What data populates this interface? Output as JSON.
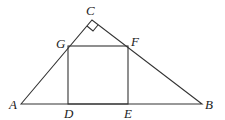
{
  "diagram": {
    "type": "geometry",
    "points": {
      "A": {
        "label": "A",
        "x": 21,
        "y": 104
      },
      "B": {
        "label": "B",
        "x": 202,
        "y": 104
      },
      "C": {
        "label": "C",
        "x": 92,
        "y": 20
      },
      "D": {
        "label": "D",
        "x": 68,
        "y": 104
      },
      "E": {
        "label": "E",
        "x": 128,
        "y": 104
      },
      "F": {
        "label": "F",
        "x": 128,
        "y": 46
      },
      "G": {
        "label": "G",
        "x": 68,
        "y": 46
      }
    },
    "labels": {
      "A": "A",
      "B": "B",
      "C": "C",
      "D": "D",
      "E": "E",
      "F": "F",
      "G": "G"
    },
    "right_angle_marker": "C"
  }
}
